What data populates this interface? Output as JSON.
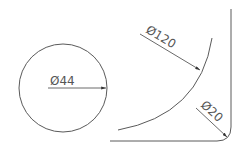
{
  "drawing": {
    "circle": {
      "cx": 63,
      "cy": 88,
      "r": 44,
      "label": "Ø44"
    },
    "large_arc": {
      "label": "Ø120"
    },
    "fillet": {
      "label": "Ø20"
    }
  },
  "colors": {
    "line": "#5a5a5a",
    "background": "#ffffff"
  }
}
